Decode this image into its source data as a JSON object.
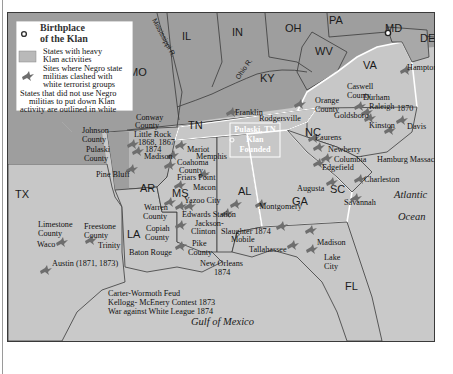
{
  "legend": {
    "birthplace_label_1": "Birthplace",
    "birthplace_label_2": "of the Klan",
    "heavy_label_1": "States with heavy",
    "heavy_label_2": "Klan activities",
    "clash_label_1": "Sites where Negro state",
    "clash_label_2": "militias clashed with",
    "clash_label_3": "white terrorist groups",
    "outline_label_1": "States that did not use Negro",
    "outline_label_2": "militias to put down Klan",
    "outline_label_3": "activity are outlined in white"
  },
  "states": {
    "PA": "PA",
    "MD": "MD",
    "DE": "DE",
    "IL": "IL",
    "IN": "IN",
    "OH": "OH",
    "WV": "WV",
    "VA": "VA",
    "MO": "MO",
    "KY": "KY",
    "TN": "TN",
    "NC": "NC",
    "AR": "AR",
    "SC": "SC",
    "TX": "TX",
    "MS": "MS",
    "AL": "AL",
    "GA": "GA",
    "LA": "LA",
    "FL": "FL"
  },
  "rivers": {
    "mississippi": "Mississippi R.",
    "ohio": "Ohio R."
  },
  "water": {
    "atlantic": "Atlantic",
    "ocean": "Ocean",
    "gulf": "Gulf of Mexico"
  },
  "birthplace_box": {
    "line1": "Pulaski, TN",
    "line2": "Klan",
    "line3": "Founded"
  },
  "sites": {
    "hampton": "Hampton",
    "caswell_1": "Caswell",
    "caswell_2": "County",
    "orange_1": "Orange",
    "orange_2": "County",
    "durham": "Durham",
    "raleigh": "Raleigh",
    "year_1870": "1870",
    "goldsboro": "Goldsboro",
    "kinston": "Kinston",
    "davis": "Davis",
    "rodgersville": "Rodgersville",
    "franklin": "Franklin",
    "laurens": "Laurens",
    "newberry": "Newberry",
    "columbia": "Columbia",
    "hamburg": "Hamburg Massacre",
    "edgefield": "Edgefield",
    "augusta": "Augusta",
    "charleston": "Charleston",
    "savannah": "Savannah",
    "johnson_1": "Johnson",
    "johnson_2": "County",
    "pulaski_co_1": "Pulaski",
    "pulaski_co_2": "County",
    "conway_1": "Conway",
    "conway_2": "County",
    "little_rock": "Little Rock",
    "lr_years_1": "1868, 1867",
    "lr_years_2": "1874",
    "madison_ar": "Madison",
    "pine_bluff": "Pine Bluff",
    "mariot": "Mariot",
    "memphis": "Memphis",
    "coahoma_1": "Coahoma",
    "coahoma_2": "County",
    "friars_point": "Friars Point",
    "macon": "Macon",
    "yazoo": "Yazoo City",
    "warren_1": "Warren",
    "warren_2": "County",
    "edwards": "Edwards Station",
    "jackson_1": "Jackson-",
    "jackson_2": "Clinton",
    "slaughter": "Slaughter 1874",
    "copiah_1": "Copiah",
    "copiah_2": "County",
    "pike_1": "Pike",
    "pike_2": "County",
    "mobile": "Mobile",
    "montgomery": "Montgomery",
    "baton_rouge": "Baton Rouge",
    "new_orleans": "New Orleans",
    "no_year": "1874",
    "tallahassee": "Tallahassee",
    "madison_fl": "Madison",
    "lake_1": "Lake",
    "lake_2": "City",
    "limestone_1": "Limestone",
    "limestone_2": "County",
    "freestone_1": "Freestone",
    "freestone_2": "County",
    "waco": "Waco",
    "trinity": "Trinity",
    "austin": "Austin (1871, 1873)",
    "carter": "Carter-Wormoth Feud",
    "kellogg": "Kellogg- McEnery Contest 1873",
    "white_league": "War against White League 1874"
  },
  "colors": {
    "heavy_fill": "#b9b9b9",
    "state_fill": "#9e9e9e",
    "light_fill": "#c7c7c7",
    "water_fill": "#c9c9c9",
    "border": "#3a3a3a",
    "white_outline": "#ffffff",
    "marker": "#6e6e6e"
  }
}
